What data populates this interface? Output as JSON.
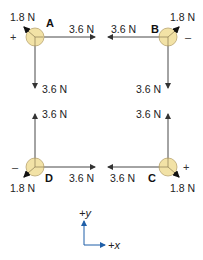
{
  "diagram": {
    "colors": {
      "circle_fill": "#f2e2a6",
      "circle_stroke": "#b9a470",
      "force_line": "#333333",
      "axis_color": "#1f5fa8"
    },
    "points": [
      {
        "id": "A",
        "label": "A",
        "sign": "+",
        "forces": {
          "horizontal": "3.6 N",
          "vertical": "3.6 N",
          "diagonal": "1.8 N"
        }
      },
      {
        "id": "B",
        "label": "B",
        "sign": "–",
        "forces": {
          "horizontal": "3.6 N",
          "vertical": "3.6 N",
          "diagonal": "1.8 N"
        }
      },
      {
        "id": "C",
        "label": "C",
        "sign": "+",
        "forces": {
          "horizontal": "3.6 N",
          "vertical": "3.6 N",
          "diagonal": "1.8 N"
        }
      },
      {
        "id": "D",
        "label": "D",
        "sign": "–",
        "forces": {
          "horizontal": "3.6 N",
          "vertical": "3.6 N",
          "diagonal": "1.8 N"
        }
      }
    ],
    "axes": {
      "y_label": "+y",
      "x_label": "+x"
    }
  }
}
